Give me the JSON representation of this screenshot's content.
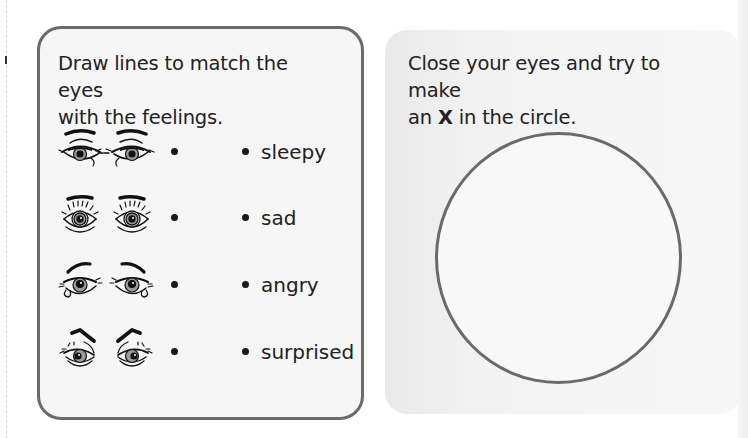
{
  "left_card": {
    "instruction_line1": "Draw lines to match the eyes",
    "instruction_line2": "with the feelings.",
    "rows": [
      {
        "eyes_icon": "sleepy-eyes-icon",
        "feeling": "sleepy"
      },
      {
        "eyes_icon": "surprised-eyes-icon",
        "feeling": "sad"
      },
      {
        "eyes_icon": "sad-eyes-icon",
        "feeling": "angry"
      },
      {
        "eyes_icon": "angry-eyes-icon",
        "feeling": "surprised"
      }
    ]
  },
  "right_card": {
    "instruction_line1": "Close your eyes and try to make",
    "instruction_line2_prefix": "an ",
    "instruction_line2_bold": "X",
    "instruction_line2_suffix": " in the circle."
  },
  "colors": {
    "card_border": "#6b6b6b",
    "circle_stroke": "#6a6a6a",
    "card_fill": "#f6f6f6",
    "text": "#222222"
  }
}
